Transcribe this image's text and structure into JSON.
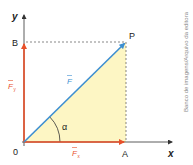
{
  "diagram": {
    "type": "vector-decomposition",
    "axes": {
      "x_label": "x",
      "y_label": "y",
      "origin_label": "0"
    },
    "points": {
      "A": "A",
      "B": "B",
      "P": "P"
    },
    "vectors": {
      "F": {
        "label": "F",
        "color": "#3d8fd1"
      },
      "Fx": {
        "label": "F",
        "subscript": "x",
        "color": "#e8502a"
      },
      "Fy": {
        "label": "F",
        "subscript": "y",
        "color": "#e8502a"
      }
    },
    "angle_label": "α",
    "fill_color": "#fdf6c4"
  },
  "credit": "Banco de imagens/Arquivo da editora"
}
